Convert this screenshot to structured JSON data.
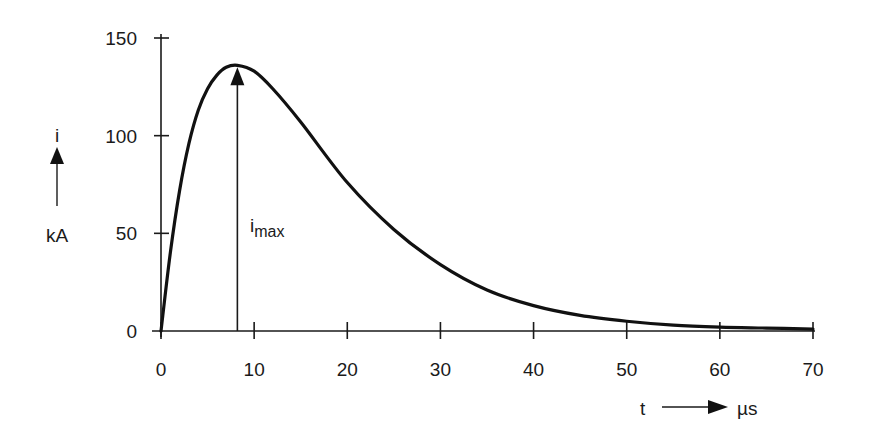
{
  "chart_data": {
    "type": "line",
    "title": "",
    "xlabel": "t",
    "xunit": "µs",
    "ylabel": "i",
    "yunit": "kA",
    "xlim": [
      0,
      70
    ],
    "ylim": [
      0,
      150
    ],
    "grid": false,
    "x_ticks": [
      0,
      10,
      20,
      30,
      40,
      50,
      60,
      70
    ],
    "y_ticks": [
      0,
      50,
      100,
      150
    ],
    "x_tick_labels": [
      "0",
      "10",
      "20",
      "30",
      "40",
      "50",
      "60",
      "70"
    ],
    "y_tick_labels": [
      "0",
      "50",
      "100",
      "150"
    ],
    "series": [
      {
        "name": "i(t)",
        "x": [
          0,
          1,
          2,
          3,
          4,
          5,
          6,
          7,
          8.2,
          10,
          12,
          15,
          20,
          25,
          30,
          35,
          40,
          45,
          50,
          55,
          60,
          65,
          70
        ],
        "values": [
          0,
          40,
          72,
          96,
          113,
          124,
          131,
          135,
          136,
          133,
          124,
          107,
          76,
          52,
          34,
          21,
          13,
          8,
          5,
          3,
          2,
          1.5,
          1
        ]
      }
    ],
    "annotations": [
      {
        "type": "arrow",
        "label": "i",
        "sub": "max",
        "x": 8.2,
        "from": 0,
        "to": 136
      }
    ]
  },
  "labels": {
    "y_symbol": "i",
    "y_unit": "kA",
    "x_symbol": "t",
    "x_unit": "µs",
    "peak_label_main": "i",
    "peak_label_sub": "max"
  }
}
